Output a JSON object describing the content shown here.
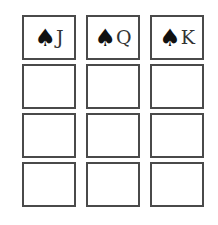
{
  "board": {
    "rows": [
      [
        {
          "suit": "♠",
          "suit_name": "spade-icon",
          "rank": "J"
        },
        {
          "suit": "♠",
          "suit_name": "spade-icon",
          "rank": "Q"
        },
        {
          "suit": "♠",
          "suit_name": "spade-icon",
          "rank": "K"
        }
      ],
      [
        {
          "suit": "",
          "rank": ""
        },
        {
          "suit": "",
          "rank": ""
        },
        {
          "suit": "",
          "rank": ""
        }
      ],
      [
        {
          "suit": "",
          "rank": ""
        },
        {
          "suit": "",
          "rank": ""
        },
        {
          "suit": "",
          "rank": ""
        }
      ],
      [
        {
          "suit": "",
          "rank": ""
        },
        {
          "suit": "",
          "rank": ""
        },
        {
          "suit": "",
          "rank": ""
        }
      ]
    ]
  },
  "colors": {
    "border": "#4a4a4a",
    "background": "#ffffff",
    "suit": "#111111"
  }
}
